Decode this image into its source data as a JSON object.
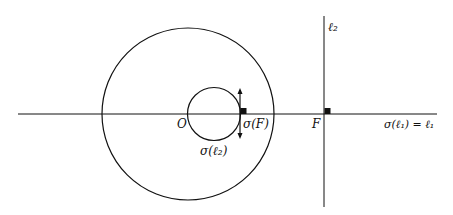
{
  "diagram": {
    "type": "inversion-geometry",
    "colors": {
      "stroke": "#111111",
      "background": "#ffffff"
    },
    "labels": {
      "origin": "O",
      "focus": "F",
      "sigma_F": "σ(F)",
      "sigma_l2": "σ(ℓ₂)",
      "l2": "ℓ₂",
      "sigma_l1_eq_l1": "σ(ℓ₁) = ℓ₁"
    },
    "elements": {
      "horizontal_line": "ℓ₁",
      "vertical_line": "ℓ₂",
      "large_circle": "circle of inversion",
      "small_circle": "σ(ℓ₂)",
      "right_angle_markers": 2,
      "double_arrow_at": "σ(F)"
    }
  }
}
